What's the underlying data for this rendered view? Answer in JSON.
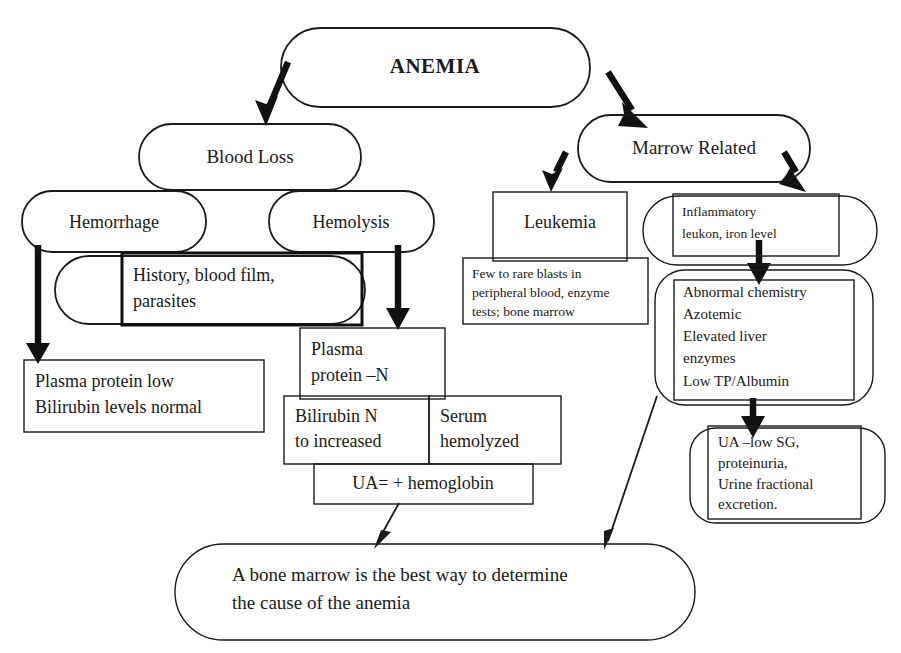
{
  "diagram": {
    "title": "ANEMIA",
    "type": "flowchart",
    "orientation": "top-down",
    "background_color": "#ffffff",
    "line_color": "#1a1a1a",
    "nodes": {
      "root": {
        "id": "anemia",
        "label": "ANEMIA",
        "shape": "rounded-rect",
        "bold": true
      },
      "blood_loss": {
        "id": "blood-loss",
        "label": "Blood Loss",
        "shape": "rounded-rect"
      },
      "marrow_related": {
        "id": "marrow-related",
        "label": "Marrow Related",
        "shape": "rounded-rect"
      },
      "hemorrhage": {
        "id": "hemorrhage",
        "label": "Hemorrhage",
        "shape": "rounded-rect"
      },
      "hemolysis": {
        "id": "hemolysis",
        "label": "Hemolysis",
        "shape": "rounded-rect"
      },
      "history": {
        "id": "history-blood-film",
        "shape": "rect-over-rounded",
        "lines": [
          "History, blood film,",
          "parasites"
        ]
      },
      "plasma_protein_low": {
        "id": "plasma-protein-low",
        "shape": "rect",
        "lines": [
          "Plasma protein low",
          "Bilirubin levels normal"
        ]
      },
      "plasma_protein_n": {
        "id": "plasma-protein-n",
        "shape": "rect",
        "lines": [
          "Plasma",
          "protein –N"
        ]
      },
      "bilirubin": {
        "id": "bilirubin-n-increased",
        "shape": "rect",
        "lines": [
          "Bilirubin  N",
          "to increased"
        ]
      },
      "serum_hemolyzed": {
        "id": "serum-hemolyzed",
        "shape": "rect",
        "lines": [
          "Serum",
          "hemolyzed"
        ]
      },
      "ua_hemoglobin": {
        "id": "ua-hemoglobin",
        "shape": "rect",
        "lines": [
          "UA= + hemoglobin"
        ]
      },
      "leukemia": {
        "id": "leukemia",
        "label": "Leukemia",
        "shape": "rect"
      },
      "inflammatory": {
        "id": "inflammatory",
        "shape": "rect-over-rounded",
        "lines": [
          "Inflammatory",
          "leukon, iron level"
        ]
      },
      "blasts": {
        "id": "few-to-rare-blasts",
        "shape": "rect",
        "lines": [
          "Few to rare blasts in",
          "peripheral blood, enzyme",
          "tests; bone marrow"
        ]
      },
      "abnormal_chem": {
        "id": "abnormal-chemistry",
        "shape": "rect-over-rounded",
        "lines": [
          "Abnormal chemistry",
          "Azotemic",
          "Elevated liver",
          "enzymes",
          "Low TP/Albumin"
        ]
      },
      "ua_low_sg": {
        "id": "ua-low-sg",
        "shape": "rect-over-rounded",
        "lines": [
          "UA –low SG,",
          "proteinuria,",
          "Urine fractional",
          "excretion."
        ]
      },
      "conclusion": {
        "id": "conclusion",
        "shape": "stadium",
        "lines": [
          "A bone marrow is the best way to determine",
          "the cause of the anemia"
        ]
      }
    },
    "edges": [
      {
        "from": "anemia",
        "to": "blood-loss",
        "style": "thick-arrow"
      },
      {
        "from": "anemia",
        "to": "marrow-related",
        "style": "thick-arrow"
      },
      {
        "from": "hemorrhage",
        "to": "plasma-protein-low",
        "style": "thick-arrow"
      },
      {
        "from": "hemolysis",
        "to": "plasma-protein-n",
        "style": "thick-arrow"
      },
      {
        "from": "marrow-related",
        "to": "leukemia",
        "style": "thick-arrow"
      },
      {
        "from": "marrow-related",
        "to": "inflammatory",
        "style": "thick-arrow"
      },
      {
        "from": "inflammatory",
        "to": "abnormal-chemistry",
        "style": "thick-arrow"
      },
      {
        "from": "abnormal-chemistry",
        "to": "ua-low-sg",
        "style": "thick-arrow"
      },
      {
        "from": "ua-hemoglobin",
        "to": "conclusion",
        "style": "thin-arrow"
      },
      {
        "from": "abnormal-chemistry",
        "to": "conclusion",
        "style": "thin-arrow"
      }
    ]
  }
}
